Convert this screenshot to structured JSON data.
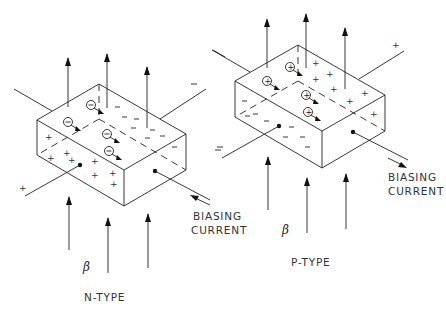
{
  "diagram": {
    "n_type": {
      "label": "N-TYPE",
      "field_symbol": "β",
      "biasing_label_line1": "BIASING",
      "biasing_label_line2": "CURRENT",
      "carrier_symbol": "−",
      "accumulated_top_charge": "−",
      "accumulated_bottom_charge": "+"
    },
    "p_type": {
      "label": "P-TYPE",
      "field_symbol": "β",
      "biasing_label_line1": "BIASING",
      "biasing_label_line2": "CURRENT",
      "carrier_symbol": "+",
      "accumulated_top_charge": "+",
      "accumulated_bottom_charge": "−"
    },
    "colors": {
      "line": "#222222",
      "background": "#ffffff"
    }
  }
}
